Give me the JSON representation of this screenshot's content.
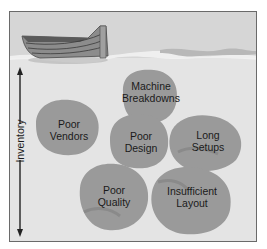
{
  "diagram": {
    "title": "",
    "axis": {
      "label": "Inventory",
      "direction": "vertical, double-headed arrow"
    },
    "boat": {
      "icon": "rowboat-icon"
    },
    "rocks": [
      {
        "id": "machine-breakdowns",
        "label": "Machine\nBreakdowns"
      },
      {
        "id": "poor-vendors",
        "label": "Poor\nVendors"
      },
      {
        "id": "poor-design",
        "label": "Poor\nDesign"
      },
      {
        "id": "long-setups",
        "label": "Long\nSetups"
      },
      {
        "id": "poor-quality",
        "label": "Poor\nQuality"
      },
      {
        "id": "insufficient-layout",
        "label": "Insufficient\nLayout"
      }
    ],
    "colors": {
      "background": "#e4e4e4",
      "water_surface": "#d6d6d6",
      "rock_fill": "#9a9a9a",
      "rock_shadow": "#8a8a8a",
      "boat_hull": "#8c8c8c",
      "boat_interior": "#5a5a5a",
      "frame": "#6a6a6a",
      "text": "#1a1a1a"
    }
  }
}
